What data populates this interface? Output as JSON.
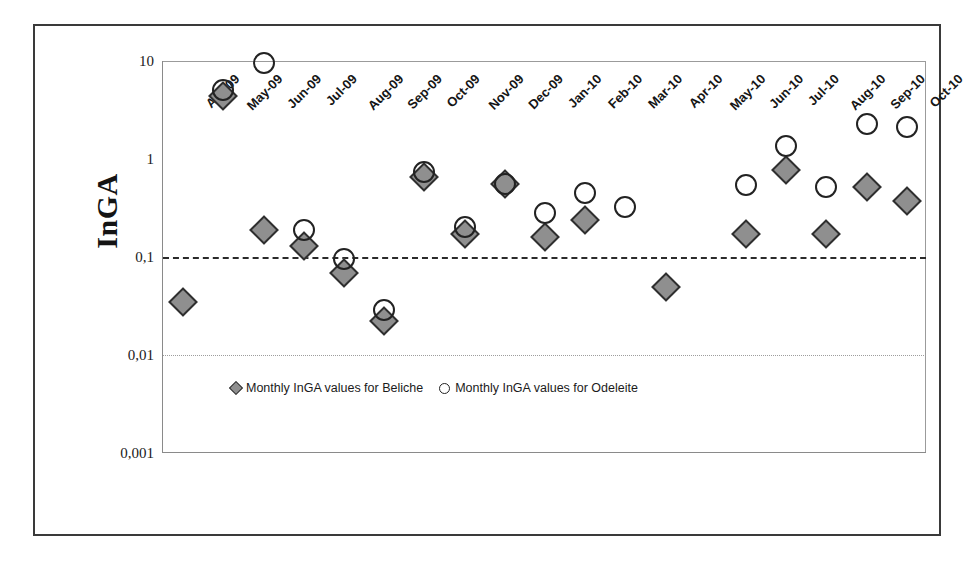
{
  "chart_data": {
    "type": "scatter",
    "title": "",
    "xlabel": "",
    "ylabel": "InGA",
    "yscale": "log",
    "ylim": [
      0.001,
      10
    ],
    "ytick_labels": [
      "10",
      "1",
      "0,1",
      "0,01",
      "0,001"
    ],
    "ytick_values": [
      10,
      1,
      0.1,
      0.01,
      0.001
    ],
    "grid": "horizontal-reference-lines at 0,1 (dash-dot) and 0,01 (dotted)",
    "legend_position": "inside-bottom-center",
    "categories": [
      "Apr-09",
      "May-09",
      "Jun-09",
      "Jul-09",
      "Aug-09",
      "Sep-09",
      "Oct-09",
      "Nov-09",
      "Dec-09",
      "Jan-10",
      "Feb-10",
      "Mar-10",
      "Apr-10",
      "May-10",
      "Jun-10",
      "Jul-10",
      "Aug-10",
      "Sep-10",
      "Oct-10"
    ],
    "series": [
      {
        "name": "Monthly InGA values for Beliche",
        "marker": "filled-diamond",
        "color": "#8f8f8f",
        "values": [
          0.035,
          4.4,
          0.19,
          0.13,
          0.068,
          0.022,
          0.66,
          0.17,
          0.55,
          0.16,
          0.24,
          null,
          0.049,
          null,
          0.17,
          0.78,
          0.17,
          0.52,
          0.37
        ]
      },
      {
        "name": "Monthly InGA values for Odeleite",
        "marker": "open-circle",
        "color": "#222222",
        "values": [
          null,
          5.1,
          9.5,
          0.19,
          0.096,
          0.029,
          0.74,
          0.2,
          0.56,
          0.28,
          0.45,
          0.32,
          null,
          null,
          0.54,
          1.35,
          0.52,
          2.3,
          2.1
        ]
      }
    ]
  },
  "legend": {
    "items": [
      {
        "label": "Monthly InGA values for Beliche",
        "marker": "filled-diamond"
      },
      {
        "label": "Monthly InGA values for Odeleite",
        "marker": "open-circle"
      }
    ]
  }
}
